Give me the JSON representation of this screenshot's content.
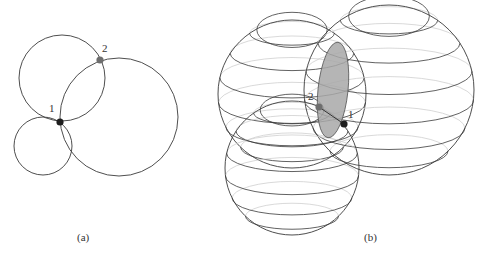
{
  "panel_a": {
    "caption": "(a)",
    "circles": [
      {
        "name": "upper-left-circle",
        "cx": 62,
        "cy": 78,
        "r": 43
      },
      {
        "name": "small-lower-circle",
        "cx": 43,
        "cy": 146,
        "r": 29
      },
      {
        "name": "large-right-circle",
        "cx": 119,
        "cy": 117,
        "r": 59
      }
    ],
    "points": [
      {
        "label": "1",
        "x": 60,
        "y": 122,
        "color": "#1e1e1e",
        "lx": 49,
        "ly": 112
      },
      {
        "label": "2",
        "x": 100,
        "y": 60,
        "color": "#6e6e6e",
        "lx": 102,
        "ly": 52
      }
    ]
  },
  "panel_b": {
    "caption": "(b)",
    "spheres": [
      {
        "name": "upper-left-sphere",
        "cx": 292,
        "cy": 94,
        "r": 74
      },
      {
        "name": "right-sphere",
        "cx": 389,
        "cy": 90,
        "r": 85
      },
      {
        "name": "bottom-sphere",
        "cx": 292,
        "cy": 168,
        "r": 67
      }
    ],
    "intersection_ellipse": {
      "cx": 333,
      "cy": 90,
      "rx": 15,
      "ry": 48,
      "rotate": 6,
      "fill": "#a8a8a8"
    },
    "points": [
      {
        "label": "1",
        "x": 344,
        "y": 124,
        "color": "#1e1e1e",
        "lx": 348,
        "ly": 118
      },
      {
        "label": "2",
        "x": 319,
        "y": 107,
        "color": "#6e6e6e",
        "lx": 308,
        "ly": 100
      }
    ],
    "connector": {
      "x1": 319,
      "y1": 107,
      "x2": 344,
      "y2": 124
    }
  }
}
